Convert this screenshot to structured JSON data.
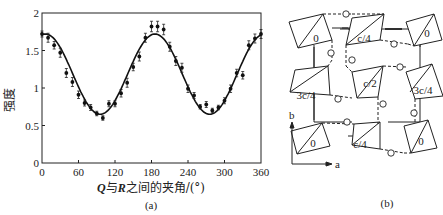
{
  "chart_data": {
    "type": "scatter",
    "title": "",
    "xlabel_parts": {
      "q": "Q",
      "mid1": "与",
      "r": "R",
      "mid2": "之间的夹角/(°)"
    },
    "xlabel": "Q与R之间的夹角/(°)",
    "ylabel": "强度",
    "xlim": [
      0,
      360
    ],
    "ylim": [
      0,
      2
    ],
    "xticks": [
      0,
      60,
      120,
      180,
      240,
      300,
      360
    ],
    "yticks": [
      0,
      0.5,
      1,
      1.5,
      2
    ],
    "ytick_labels": [
      "0",
      "0.5",
      "1",
      "1.5",
      "2"
    ],
    "xtick_labels": [
      "0",
      "60",
      "120",
      "180",
      "240",
      "300",
      "360"
    ],
    "grid": false,
    "caption": "(a)",
    "fit_curve": {
      "name": "fit",
      "description": "cosine fit, amplitude ~0.54, offset ~1.18, period 180°",
      "x": [
        0,
        15,
        30,
        45,
        60,
        75,
        90,
        105,
        120,
        135,
        150,
        165,
        180,
        195,
        210,
        225,
        240,
        255,
        270,
        285,
        300,
        315,
        330,
        345,
        360
      ],
      "y": [
        1.72,
        1.69,
        1.58,
        1.41,
        1.2,
        0.99,
        0.8,
        0.68,
        0.65,
        0.72,
        0.87,
        1.07,
        1.3,
        1.5,
        1.65,
        1.72,
        1.7,
        1.59,
        1.41,
        1.2,
        0.98,
        0.8,
        0.68,
        0.65,
        0.72
      ]
    },
    "series": [
      {
        "name": "measured",
        "x": [
          0,
          10,
          20,
          30,
          40,
          50,
          60,
          70,
          80,
          90,
          100,
          110,
          120,
          130,
          140,
          150,
          160,
          170,
          180,
          190,
          200,
          210,
          220,
          230,
          240,
          250,
          260,
          270,
          280,
          290,
          300,
          310,
          320,
          330,
          340,
          350,
          360
        ],
        "y": [
          1.72,
          1.67,
          1.57,
          1.47,
          1.2,
          1.08,
          0.91,
          0.8,
          0.74,
          0.66,
          0.6,
          0.79,
          0.79,
          0.93,
          1.07,
          1.28,
          1.42,
          1.67,
          1.82,
          1.82,
          1.78,
          1.55,
          1.36,
          1.27,
          0.99,
          0.9,
          0.75,
          0.78,
          0.7,
          0.74,
          0.83,
          0.99,
          1.2,
          1.17,
          1.57,
          1.66,
          1.72
        ],
        "yerr": [
          0.04,
          0.06,
          0.05,
          0.06,
          0.06,
          0.06,
          0.05,
          0.04,
          0.04,
          0.03,
          0.03,
          0.04,
          0.04,
          0.05,
          0.06,
          0.05,
          0.06,
          0.06,
          0.07,
          0.07,
          0.07,
          0.06,
          0.06,
          0.06,
          0.05,
          0.04,
          0.03,
          0.04,
          0.03,
          0.03,
          0.04,
          0.05,
          0.05,
          0.05,
          0.06,
          0.06,
          0.06
        ]
      }
    ]
  },
  "diagram": {
    "caption": "(b)",
    "axis_labels": {
      "b": "b",
      "a": "a"
    },
    "cells": [
      {
        "label": "0"
      },
      {
        "label": "c/4"
      },
      {
        "label": "0"
      },
      {
        "label": "3c/4"
      },
      {
        "label": "c/2"
      },
      {
        "label": "3c/4"
      },
      {
        "label": "0"
      },
      {
        "label": "c/4"
      },
      {
        "label": "0"
      }
    ]
  }
}
